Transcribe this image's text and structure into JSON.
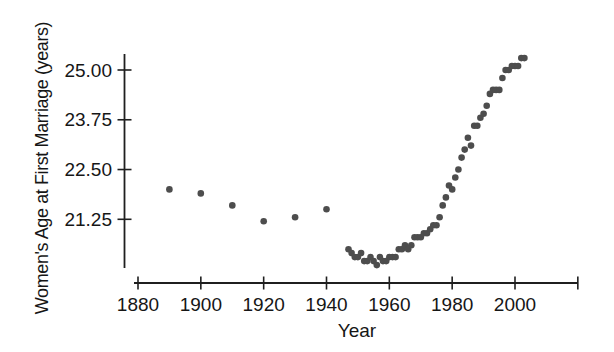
{
  "chart_data": {
    "type": "scatter",
    "title": "",
    "xlabel": "Year",
    "ylabel": "Women's Age at First Marriage (years)",
    "xlim": [
      1876,
      2021
    ],
    "ylim": [
      19.95,
      25.45
    ],
    "grid": false,
    "legend": null,
    "axis_color": "#1f1f1f",
    "label_color": "#161616",
    "background_color": "#ffffff",
    "marker": {
      "shape": "circle",
      "radius_px": 3.3,
      "color": "#4d4d4d"
    },
    "x_ticks": [
      {
        "value": 1880,
        "label": "1880"
      },
      {
        "value": 1900,
        "label": "1900"
      },
      {
        "value": 1920,
        "label": "1920"
      },
      {
        "value": 1940,
        "label": "1940"
      },
      {
        "value": 1960,
        "label": "1960"
      },
      {
        "value": 1980,
        "label": "1980"
      },
      {
        "value": 2000,
        "label": "2000"
      },
      {
        "value": 2020,
        "label": ""
      }
    ],
    "y_ticks": [
      {
        "value": 25.0,
        "label": "25.00"
      },
      {
        "value": 23.75,
        "label": "23.75"
      },
      {
        "value": 22.5,
        "label": "22.50"
      },
      {
        "value": 21.25,
        "label": "21.25"
      }
    ],
    "points": [
      [
        1890,
        22.0
      ],
      [
        1900,
        21.9
      ],
      [
        1910,
        21.6
      ],
      [
        1920,
        21.2
      ],
      [
        1930,
        21.3
      ],
      [
        1940,
        21.5
      ],
      [
        1947,
        20.5
      ],
      [
        1948,
        20.4
      ],
      [
        1949,
        20.3
      ],
      [
        1950,
        20.3
      ],
      [
        1951,
        20.4
      ],
      [
        1952,
        20.2
      ],
      [
        1953,
        20.2
      ],
      [
        1954,
        20.3
      ],
      [
        1955,
        20.2
      ],
      [
        1956,
        20.1
      ],
      [
        1957,
        20.3
      ],
      [
        1958,
        20.2
      ],
      [
        1959,
        20.2
      ],
      [
        1960,
        20.3
      ],
      [
        1961,
        20.3
      ],
      [
        1962,
        20.3
      ],
      [
        1963,
        20.5
      ],
      [
        1964,
        20.5
      ],
      [
        1965,
        20.6
      ],
      [
        1966,
        20.5
      ],
      [
        1967,
        20.6
      ],
      [
        1968,
        20.8
      ],
      [
        1969,
        20.8
      ],
      [
        1970,
        20.8
      ],
      [
        1971,
        20.9
      ],
      [
        1972,
        20.9
      ],
      [
        1973,
        21.0
      ],
      [
        1974,
        21.1
      ],
      [
        1975,
        21.1
      ],
      [
        1976,
        21.3
      ],
      [
        1977,
        21.6
      ],
      [
        1978,
        21.8
      ],
      [
        1979,
        22.1
      ],
      [
        1980,
        22.0
      ],
      [
        1981,
        22.3
      ],
      [
        1982,
        22.5
      ],
      [
        1983,
        22.8
      ],
      [
        1984,
        23.0
      ],
      [
        1985,
        23.3
      ],
      [
        1986,
        23.1
      ],
      [
        1987,
        23.6
      ],
      [
        1988,
        23.6
      ],
      [
        1989,
        23.8
      ],
      [
        1990,
        23.9
      ],
      [
        1991,
        24.1
      ],
      [
        1992,
        24.4
      ],
      [
        1993,
        24.5
      ],
      [
        1994,
        24.5
      ],
      [
        1995,
        24.5
      ],
      [
        1996,
        24.8
      ],
      [
        1997,
        25.0
      ],
      [
        1998,
        25.0
      ],
      [
        1999,
        25.1
      ],
      [
        2000,
        25.1
      ],
      [
        2001,
        25.1
      ],
      [
        2002,
        25.3
      ],
      [
        2003,
        25.3
      ]
    ]
  }
}
